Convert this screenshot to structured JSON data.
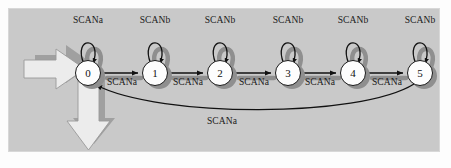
{
  "figure": {
    "kind": "state-transition-diagram",
    "width": 451,
    "height": 168,
    "panel_color": "#c9c9c9",
    "node_fill": "#fdfdfd",
    "node_stroke": "#1a1a1a",
    "shadow_color": "#8f8f8f",
    "block_arrow_fill": "#e8e8e8",
    "block_arrow_shadow": "#a8a8a8"
  },
  "nodes": [
    {
      "label": "0",
      "x": 88,
      "y": 73
    },
    {
      "label": "1",
      "x": 155,
      "y": 73
    },
    {
      "label": "2",
      "x": 220,
      "y": 73
    },
    {
      "label": "3",
      "x": 288,
      "y": 73
    },
    {
      "label": "4",
      "x": 353,
      "y": 73
    },
    {
      "label": "5",
      "x": 420,
      "y": 73
    }
  ],
  "self_loops": [
    {
      "from": "0",
      "label": "SCANa",
      "x": 88,
      "y": 21
    },
    {
      "from": "1",
      "label": "SCANb",
      "x": 155,
      "y": 21
    },
    {
      "from": "2",
      "label": "SCANb",
      "x": 220,
      "y": 21
    },
    {
      "from": "3",
      "label": "SCANb",
      "x": 288,
      "y": 21
    },
    {
      "from": "4",
      "label": "SCANb",
      "x": 353,
      "y": 21
    },
    {
      "from": "5",
      "label": "SCANb",
      "x": 420,
      "y": 21
    }
  ],
  "transitions": [
    {
      "from": "0",
      "to": "1",
      "label": "SCANa",
      "x": 122,
      "y": 82
    },
    {
      "from": "1",
      "to": "2",
      "label": "SCANa",
      "x": 188,
      "y": 82
    },
    {
      "from": "2",
      "to": "3",
      "label": "SCANa",
      "x": 254,
      "y": 82
    },
    {
      "from": "3",
      "to": "4",
      "label": "SCANa",
      "x": 320,
      "y": 82
    },
    {
      "from": "4",
      "to": "5",
      "label": "SCANa",
      "x": 387,
      "y": 82
    }
  ],
  "return_transition": {
    "from": "5",
    "to": "0",
    "label": "SCANa",
    "x": 222,
    "y": 118
  },
  "block_arrows": [
    {
      "name": "input-arrow",
      "direction": "right",
      "target": "0"
    },
    {
      "name": "output-arrow",
      "direction": "down",
      "source": "0"
    }
  ]
}
